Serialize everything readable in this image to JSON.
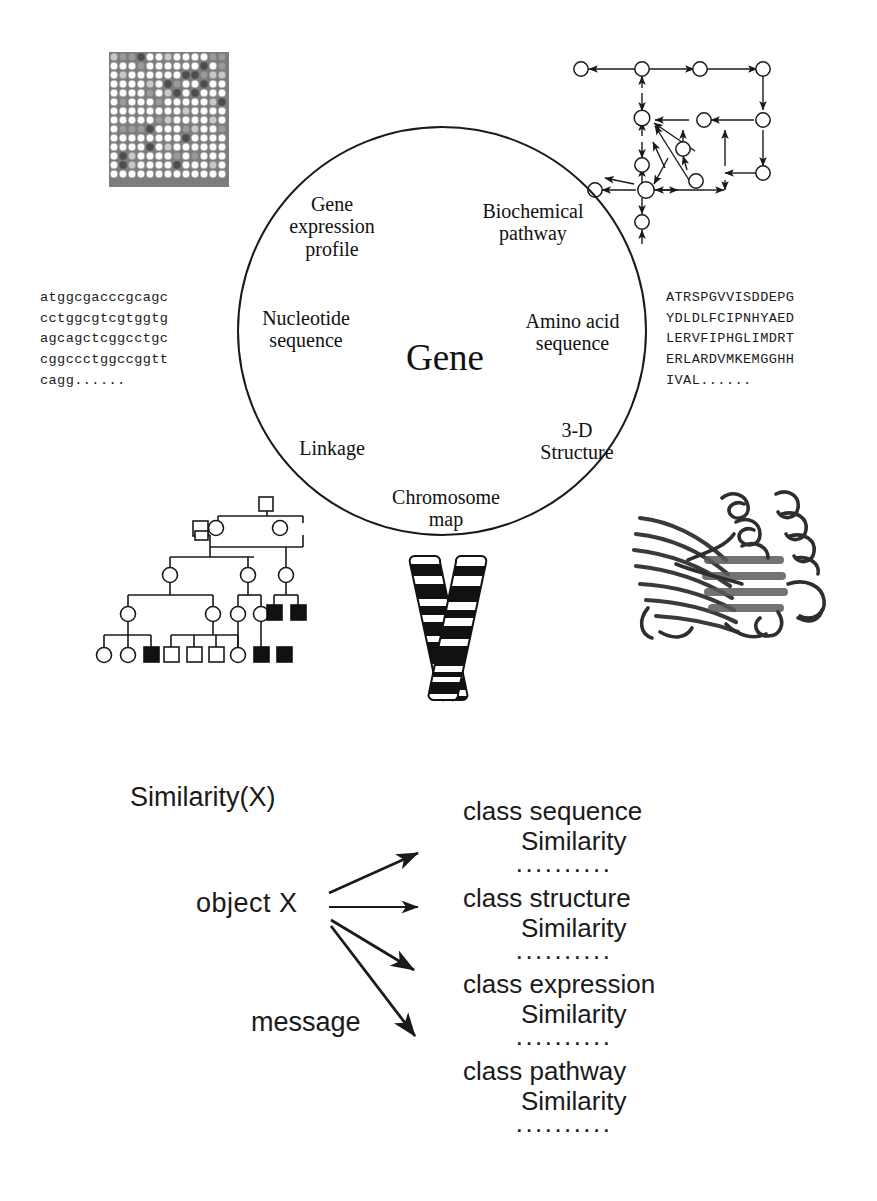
{
  "figure": {
    "top_panel": {
      "center_label": "Gene",
      "aspect_labels": [
        {
          "id": "gene-expression-profile",
          "text": "Gene\nexpression\nprofile"
        },
        {
          "id": "biochemical-pathway",
          "text": "Biochemical\npathway"
        },
        {
          "id": "nucleotide-sequence",
          "text": "Nucleotide\nsequence"
        },
        {
          "id": "amino-acid-sequence",
          "text": "Amino acid\nsequence"
        },
        {
          "id": "linkage",
          "text": "Linkage"
        },
        {
          "id": "3d-structure",
          "text": "3-D\nStructure"
        },
        {
          "id": "chromosome-map",
          "text": "Chromosome\nmap"
        }
      ],
      "nucleotide_sequence": "atggcgacccgcagc\ncctggcgtcgtggtg\nagcagctcggcctgc\ncggccctggccggtt\ncagg......",
      "amino_acid_sequence": "ATRSPGVVISDDEPG\nYDLDLFCIPNHYAED\nLERVFIPHGLIMDRT\nERLARDVMKEMGGHH\nIVAL......"
    },
    "bottom_panel": {
      "title": "Similarity(X)",
      "object_label": "object  X",
      "message_label": "message",
      "classes": [
        {
          "name": "class sequence",
          "similarity": "Similarity",
          "separator": "··········"
        },
        {
          "name": "class structure",
          "similarity": "Similarity",
          "separator": "··········"
        },
        {
          "name": "class expression",
          "similarity": "Similarity",
          "separator": "··········"
        },
        {
          "name": "class pathway",
          "similarity": "Similarity",
          "separator": "··········"
        }
      ]
    },
    "illustrations": [
      {
        "id": "microarray-grid",
        "description": "gene expression microarray spot grid"
      },
      {
        "id": "pathway-network",
        "description": "biochemical pathway node-and-arrow graph"
      },
      {
        "id": "pedigree-chart",
        "description": "linkage pedigree with squares and circles"
      },
      {
        "id": "chromosome-ideogram",
        "description": "banded X-shaped chromosome"
      },
      {
        "id": "protein-ribbon",
        "description": "3-D protein ribbon structure"
      }
    ],
    "colors": {
      "ink": "#1a1a1a",
      "paper": "#ffffff",
      "spot_light": "#fdfdfd",
      "spot_mid": "#9a9a9a",
      "spot_dark": "#4d4d4d"
    }
  }
}
